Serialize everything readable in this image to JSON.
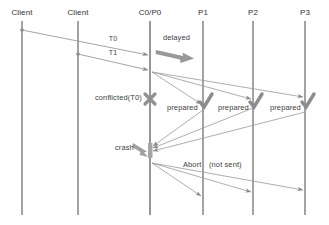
{
  "diagram": {
    "colors": {
      "lifeline": "#8c8c8c",
      "arrow": "#8a8a8a",
      "text": "#3a3a3a",
      "accent_gray": "#9a9a9a",
      "background": "#fefefe"
    },
    "lifelines": [
      {
        "id": "client1",
        "label": "Client",
        "x": 22
      },
      {
        "id": "client2",
        "label": "Client",
        "x": 78
      },
      {
        "id": "c0p0",
        "label": "C0/P0",
        "x": 150
      },
      {
        "id": "p1",
        "label": "P1",
        "x": 203
      },
      {
        "id": "p2",
        "label": "P2",
        "x": 253
      },
      {
        "id": "p3",
        "label": "P3",
        "x": 305
      }
    ],
    "lifeline_top": 21,
    "lifeline_bottom": 215,
    "messages": [
      {
        "id": "t0",
        "label": "T0",
        "from": "client1",
        "to": "c0p0",
        "y1": 30,
        "y2": 55,
        "label_x": 113,
        "label_y": 36
      },
      {
        "id": "t1",
        "label": "T1",
        "from": "client2",
        "to": "c0p0",
        "y1": 54,
        "y2": 70,
        "label_x": 113,
        "label_y": 50
      },
      {
        "id": "prepare-p1",
        "label": "",
        "from": "c0p0",
        "to": "p1",
        "y1": 72,
        "y2": 105
      },
      {
        "id": "prepare-p2",
        "label": "",
        "from": "c0p0",
        "to": "p2",
        "y1": 72,
        "y2": 100
      },
      {
        "id": "prepare-p3",
        "label": "",
        "from": "c0p0",
        "to": "p3",
        "y1": 72,
        "y2": 98
      },
      {
        "id": "ack-p1",
        "label": "",
        "from": "p1",
        "to": "c0p0",
        "y1": 110,
        "y2": 147
      },
      {
        "id": "ack-p2",
        "label": "",
        "from": "p2",
        "to": "c0p0",
        "y1": 108,
        "y2": 149
      },
      {
        "id": "ack-p3",
        "label": "",
        "from": "p3",
        "to": "c0p0",
        "y1": 112,
        "y2": 151
      },
      {
        "id": "abort-p1",
        "label": "",
        "from": "c0p0",
        "to": "p1",
        "y1": 163,
        "y2": 197
      },
      {
        "id": "abort-p2",
        "label": "",
        "from": "c0p0",
        "to": "p2",
        "y1": 163,
        "y2": 192
      },
      {
        "id": "abort-p3",
        "label": "",
        "from": "c0p0",
        "to": "p3",
        "y1": 163,
        "y2": 190
      }
    ],
    "annotations": [
      {
        "id": "delayed",
        "label": "delayed",
        "x": 186,
        "y": 40,
        "align": "center"
      },
      {
        "id": "conflicted-t0",
        "label": "conflicted(T0)",
        "x": 143,
        "y": 98,
        "align": "right"
      },
      {
        "id": "prepared-p1",
        "label": "prepared",
        "x": 197,
        "y": 108,
        "align": "right"
      },
      {
        "id": "prepared-p2",
        "label": "prepared",
        "x": 247,
        "y": 108,
        "align": "right"
      },
      {
        "id": "prepared-p3",
        "label": "prepared",
        "x": 299,
        "y": 108,
        "align": "right"
      },
      {
        "id": "crash",
        "label": "crash",
        "x": 131,
        "y": 148,
        "align": "right"
      },
      {
        "id": "abort",
        "label": "Abort",
        "x": 183,
        "y": 165,
        "align": "left"
      },
      {
        "id": "not-sent",
        "label": "(not sent)",
        "x": 209,
        "y": 165,
        "align": "left"
      }
    ],
    "markers": {
      "cross": {
        "id": "conflict-cross",
        "name": "x-cross-marker",
        "x": 150,
        "y": 100
      },
      "crash_arrow": {
        "id": "crash-arrow",
        "name": "crash-arrow-marker",
        "x": 138,
        "y": 152
      },
      "delayed_arrow": {
        "id": "delayed-arrow",
        "name": "delayed-thick-arrow",
        "x": 163,
        "y": 53
      },
      "checks": [
        {
          "id": "check-p1",
          "name": "check-mark-p1",
          "x": 205,
          "y": 101
        },
        {
          "id": "check-p2",
          "name": "check-mark-p2",
          "x": 255,
          "y": 101
        },
        {
          "id": "check-p3",
          "name": "check-mark-p3",
          "x": 307,
          "y": 101
        }
      ],
      "activation": {
        "id": "activation-bar",
        "x": 150,
        "y": 143,
        "w": 4,
        "h": 14
      }
    }
  }
}
